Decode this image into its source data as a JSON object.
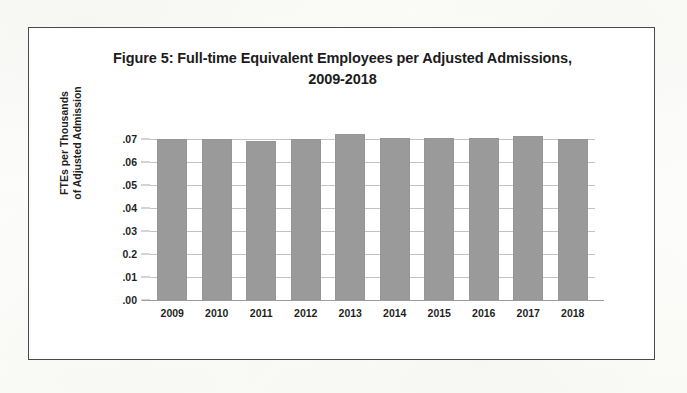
{
  "figure": {
    "title_line1": "Figure 5: Full-time Equivalent Employees per Adjusted Admissions,",
    "title_line2": "2009-2018",
    "border_color": "#4a4a4a",
    "background_color": "#ffffff"
  },
  "axes": {
    "y_title_line1": "FTEs per Thousands",
    "y_title_line2": "of Adjusted Admission",
    "y_tick_labels": [
      ".07",
      ".06",
      ".05",
      ".04",
      ".03",
      "0.2",
      ".01",
      ".00"
    ],
    "x_tick_labels": [
      "2009",
      "2010",
      "2011",
      "2012",
      "2013",
      "2014",
      "2015",
      "2016",
      "2017",
      "2018"
    ]
  },
  "chart_data": {
    "type": "bar",
    "title": "Figure 5: Full-time Equivalent Employees per Adjusted Admissions, 2009-2018",
    "xlabel": "",
    "ylabel": "FTEs per Thousands of Adjusted Admission",
    "categories": [
      "2009",
      "2010",
      "2011",
      "2012",
      "2013",
      "2014",
      "2015",
      "2016",
      "2017",
      "2018"
    ],
    "values": [
      0.07,
      0.07,
      0.069,
      0.07,
      0.0722,
      0.0705,
      0.0706,
      0.0706,
      0.0713,
      0.07
    ],
    "ylim": [
      0,
      0.08
    ],
    "ytick_values": [
      0.07,
      0.06,
      0.05,
      0.04,
      0.03,
      0.02,
      0.01,
      0.0
    ],
    "ytick_labels": [
      ".07",
      ".06",
      ".05",
      ".04",
      ".03",
      "0.2",
      ".01",
      ".00"
    ],
    "grid": true,
    "legend": false,
    "bar_color": "#9a9a9a",
    "gridline_color": "#c3c3c3"
  }
}
